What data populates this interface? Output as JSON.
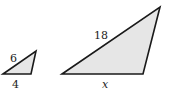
{
  "diagram": {
    "small_triangle": {
      "side_label_hyp": "6",
      "side_label_base": "4",
      "points": "3,74 36,51 31,74"
    },
    "large_triangle": {
      "side_label_hyp": "18",
      "side_label_base": "x",
      "points": "62,74 160,7 143,74"
    },
    "colors": {
      "fill": "#e6e6e6",
      "stroke": "#1a1a1a"
    }
  }
}
